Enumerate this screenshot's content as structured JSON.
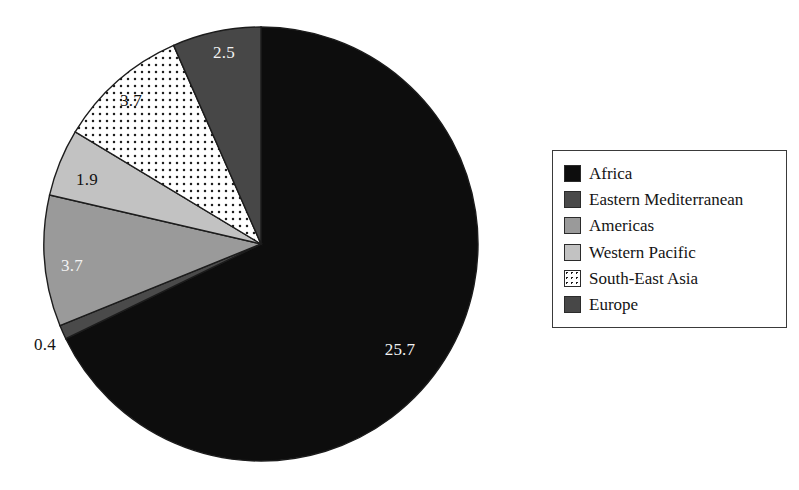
{
  "chart_data": {
    "type": "pie",
    "title": "",
    "subtitle": "",
    "xlabel": "",
    "ylabel": "",
    "legend_position": "right",
    "grid": false,
    "total": 37.9,
    "categories": [
      "Africa",
      "Eastern Mediterranean",
      "Americas",
      "Western Pacific",
      "South-East Asia",
      "Europe"
    ],
    "values": [
      25.7,
      0.4,
      3.7,
      1.9,
      3.7,
      2.5
    ],
    "labels": [
      "25.7",
      "0.4",
      "3.7",
      "1.9",
      "3.7",
      "2.5"
    ],
    "slices": [
      {
        "name": "Africa",
        "value": 25.7,
        "label": "25.7",
        "fill": "#0d0d0d",
        "pattern": "solid",
        "label_color": "light",
        "label_placement": "inside",
        "label_x": 400,
        "label_y": 350
      },
      {
        "name": "Eastern Mediterranean",
        "value": 0.4,
        "label": "0.4",
        "fill": "#4a4a4a",
        "pattern": "solid",
        "label_color": "outside",
        "label_placement": "outside",
        "label_x": 45,
        "label_y": 345
      },
      {
        "name": "Americas",
        "value": 3.7,
        "label": "3.7",
        "fill": "#9a9a9a",
        "pattern": "solid",
        "label_color": "light",
        "label_placement": "inside",
        "label_x": 72,
        "label_y": 266
      },
      {
        "name": "Western Pacific",
        "value": 1.9,
        "label": "1.9",
        "fill": "#c2c2c2",
        "pattern": "solid",
        "label_color": "dark",
        "label_placement": "inside",
        "label_x": 87,
        "label_y": 180
      },
      {
        "name": "South-East Asia",
        "value": 3.7,
        "label": "3.7",
        "fill": "#ffffff",
        "pattern": "dotted",
        "label_color": "dark",
        "label_placement": "inside",
        "label_x": 131,
        "label_y": 101
      },
      {
        "name": "Europe",
        "value": 2.5,
        "label": "2.5",
        "fill": "#474747",
        "pattern": "solid",
        "label_color": "light",
        "label_placement": "inside",
        "label_x": 224,
        "label_y": 53
      }
    ],
    "geometry": {
      "center_x": 261,
      "center_y": 244,
      "radius": 217,
      "start_angle_deg": 0,
      "direction": "clockwise"
    }
  },
  "legend": {
    "items": [
      {
        "label": "Africa",
        "swatch": "#0d0d0d",
        "pattern": "solid"
      },
      {
        "label": "Eastern Mediterranean",
        "swatch": "#4a4a4a",
        "pattern": "solid"
      },
      {
        "label": "Americas",
        "swatch": "#9a9a9a",
        "pattern": "solid"
      },
      {
        "label": "Western Pacific",
        "swatch": "#c2c2c2",
        "pattern": "solid"
      },
      {
        "label": "South-East Asia",
        "swatch": "#ffffff",
        "pattern": "dotted"
      },
      {
        "label": "Europe",
        "swatch": "#474747",
        "pattern": "solid"
      }
    ]
  }
}
